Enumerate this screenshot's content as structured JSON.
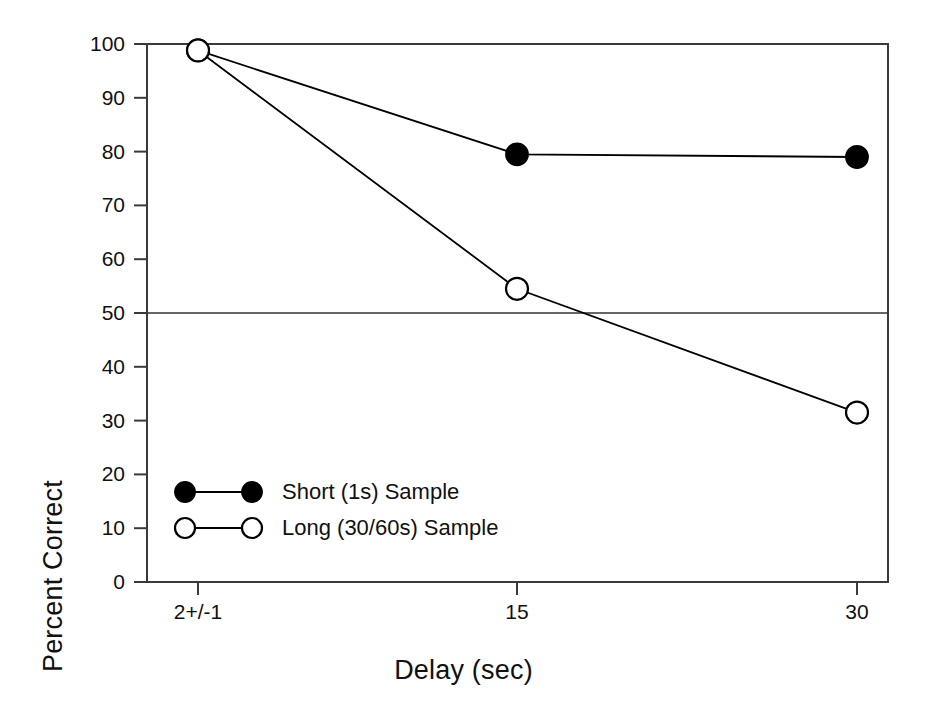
{
  "chart_data": {
    "type": "line",
    "title": "",
    "xlabel": "Delay (sec)",
    "ylabel": "Percent Correct",
    "categories": [
      "2+/-1",
      "15",
      "30"
    ],
    "ylim": [
      0,
      100
    ],
    "ytick_labels": [
      "0",
      "10",
      "20",
      "30",
      "40",
      "50",
      "60",
      "70",
      "80",
      "90",
      "100"
    ],
    "yticks": [
      0,
      10,
      20,
      30,
      40,
      50,
      60,
      70,
      80,
      90,
      100
    ],
    "grid": false,
    "legend_position": "inside lower-left",
    "reference_line": {
      "value": 50,
      "label": "chance",
      "color": "#333333"
    },
    "series": [
      {
        "name": "Short (1s) Sample",
        "marker": "filled-circle",
        "color": "#000000",
        "values": [
          98.8,
          79.5,
          79.0
        ]
      },
      {
        "name": "Long (30/60s) Sample",
        "marker": "open-circle",
        "color": "#000000",
        "values": [
          98.8,
          54.5,
          31.5
        ]
      }
    ]
  },
  "legend": {
    "entries": [
      {
        "label": "Short (1s) Sample",
        "marker": "filled-circle"
      },
      {
        "label": "Long (30/60s) Sample",
        "marker": "open-circle"
      }
    ]
  },
  "colors": {
    "axis": "#3a3a3a",
    "ink": "#111111",
    "background": "#ffffff"
  }
}
